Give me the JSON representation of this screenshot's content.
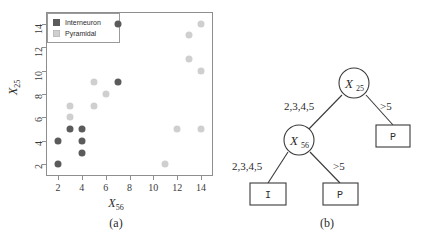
{
  "figure": {
    "panel_a_caption": "(a)",
    "panel_b_caption": "(b)"
  },
  "chart_data": {
    "type": "scatter",
    "title": "",
    "xlabel": "X56",
    "ylabel": "X25",
    "xlim": [
      1,
      15
    ],
    "ylim": [
      1,
      15
    ],
    "xticks": [
      2,
      4,
      6,
      8,
      10,
      12,
      14
    ],
    "yticks": [
      2,
      4,
      6,
      8,
      10,
      12,
      14
    ],
    "grid": false,
    "legend_position": "top-left",
    "series": [
      {
        "name": "Interneuron",
        "color": "#5b5b5b",
        "marker": "filled-circle",
        "points": [
          {
            "x": 2,
            "y": 2
          },
          {
            "x": 2,
            "y": 4
          },
          {
            "x": 3,
            "y": 5
          },
          {
            "x": 4,
            "y": 5
          },
          {
            "x": 4,
            "y": 4
          },
          {
            "x": 4,
            "y": 3
          },
          {
            "x": 7,
            "y": 9
          },
          {
            "x": 7,
            "y": 14
          }
        ]
      },
      {
        "name": "Pyramidal",
        "color": "#cfcfcf",
        "marker": "filled-circle",
        "points": [
          {
            "x": 3,
            "y": 7
          },
          {
            "x": 3,
            "y": 6
          },
          {
            "x": 5,
            "y": 9
          },
          {
            "x": 5,
            "y": 7
          },
          {
            "x": 6,
            "y": 8
          },
          {
            "x": 11,
            "y": 2
          },
          {
            "x": 12,
            "y": 5
          },
          {
            "x": 13,
            "y": 13
          },
          {
            "x": 13,
            "y": 11
          },
          {
            "x": 14,
            "y": 14
          },
          {
            "x": 14,
            "y": 10
          },
          {
            "x": 14,
            "y": 5
          }
        ]
      }
    ]
  },
  "legend": {
    "items": [
      {
        "label": "Interneuron",
        "color": "#5b5b5b"
      },
      {
        "label": "Pyramidal",
        "color": "#cfcfcf"
      }
    ]
  },
  "axes": {
    "x_title": "X",
    "x_title_sub": "56",
    "y_title": "X",
    "y_title_sub": "25",
    "x_tick_labels": [
      "2",
      "4",
      "6",
      "8",
      "10",
      "12",
      "14"
    ],
    "y_tick_labels": [
      "2",
      "4",
      "6",
      "8",
      "10",
      "12",
      "14"
    ]
  },
  "tree": {
    "nodes": [
      {
        "id": "root",
        "kind": "internal",
        "label": "X",
        "sub": "25"
      },
      {
        "id": "n2",
        "kind": "internal",
        "label": "X",
        "sub": "56"
      },
      {
        "id": "leaf_p_right",
        "kind": "leaf",
        "label": "P"
      },
      {
        "id": "leaf_i",
        "kind": "leaf",
        "label": "I"
      },
      {
        "id": "leaf_p_mid",
        "kind": "leaf",
        "label": "P"
      }
    ],
    "edges": [
      {
        "from": "root",
        "to": "n2",
        "label": "2,3,4,5"
      },
      {
        "from": "root",
        "to": "leaf_p_right",
        "label": ">5"
      },
      {
        "from": "n2",
        "to": "leaf_i",
        "label": "2,3,4,5"
      },
      {
        "from": "n2",
        "to": "leaf_p_mid",
        "label": ">5"
      }
    ]
  }
}
